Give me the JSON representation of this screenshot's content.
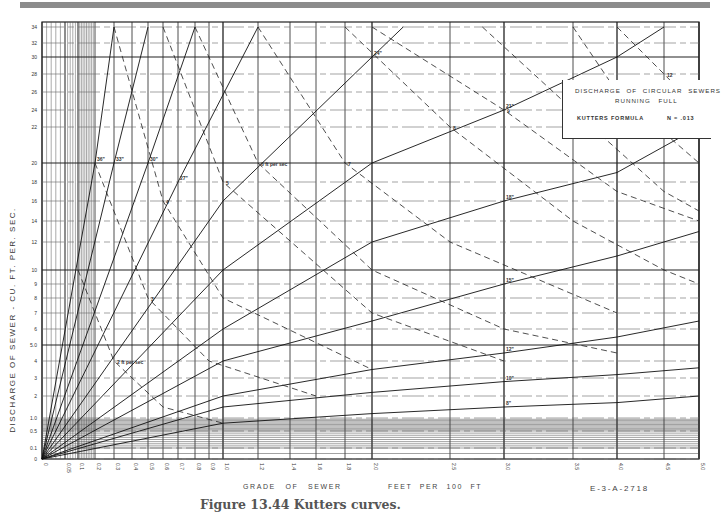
{
  "figure": {
    "caption": "Figure 13.44 Kutters curves.",
    "drawing_number": "E-3-A-2718"
  },
  "title_box": {
    "line1": "DISCHARGE OF CIRCULAR SEWERS",
    "line2": "RUNNING FULL",
    "formula": "KUTTERS FORMULA",
    "n_value": "N = .013"
  },
  "axes": {
    "ylabel": "DISCHARGE OF SEWER - CU. FT. PER. SEC.",
    "xlabel_left": "GRADE OF SEWER",
    "xlabel_right": "FEET PER 100 FT"
  },
  "chart_data": {
    "type": "line",
    "xlabel": "Grade of sewer, feet per 100 ft",
    "ylabel": "Discharge of sewer - cu. ft. per sec.",
    "x_ticks": [
      "0",
      "0.05",
      "0.1",
      "0.2",
      "0.3",
      "0.4",
      "0.5",
      "0.6",
      "0.7",
      "0.8",
      "0.9",
      "1.0",
      "1.2",
      "1.4",
      "1.6",
      "1.8",
      "2.0",
      "2.5",
      "3.0",
      "3.5",
      "4.0",
      "4.5",
      "5.0"
    ],
    "y_ticks": [
      "0",
      "0.1",
      "0.5",
      "1.0",
      "2",
      "3",
      "4",
      "5.0",
      "6",
      "7",
      "8",
      "9",
      "10",
      "12",
      "14",
      "16",
      "18",
      "20",
      "22",
      "24",
      "26",
      "28",
      "30",
      "32",
      "34"
    ],
    "xlim": [
      0,
      5.0
    ],
    "ylim": [
      0,
      34
    ],
    "grid": true,
    "legend_position": "none (curves labeled inline)",
    "pipe_diameter_series": [
      {
        "name": "36\"",
        "style": "solid",
        "points": [
          [
            0.0,
            0
          ],
          [
            0.2,
            20
          ],
          [
            0.3,
            34
          ]
        ]
      },
      {
        "name": "33\"",
        "style": "solid",
        "points": [
          [
            0.0,
            0
          ],
          [
            0.3,
            20
          ],
          [
            0.5,
            34
          ]
        ]
      },
      {
        "name": "30\"",
        "style": "solid",
        "points": [
          [
            0.0,
            0
          ],
          [
            0.5,
            20
          ],
          [
            0.8,
            34
          ]
        ]
      },
      {
        "name": "27\"",
        "style": "solid",
        "points": [
          [
            0.0,
            0
          ],
          [
            0.7,
            18
          ],
          [
            1.2,
            34
          ]
        ]
      },
      {
        "name": "24\"",
        "style": "solid",
        "points": [
          [
            0.0,
            0
          ],
          [
            1.0,
            16
          ],
          [
            2.0,
            30
          ],
          [
            2.2,
            34
          ]
        ]
      },
      {
        "name": "21\"",
        "style": "solid",
        "points": [
          [
            0.0,
            0
          ],
          [
            1.0,
            10
          ],
          [
            2.0,
            20
          ],
          [
            3.0,
            24
          ],
          [
            4.0,
            30
          ],
          [
            4.5,
            34
          ]
        ]
      },
      {
        "name": "18\"",
        "style": "solid",
        "points": [
          [
            0.0,
            0
          ],
          [
            1.0,
            6
          ],
          [
            2.0,
            12
          ],
          [
            3.0,
            16
          ],
          [
            4.0,
            19
          ],
          [
            5.0,
            22
          ]
        ]
      },
      {
        "name": "15\"",
        "style": "solid",
        "points": [
          [
            0.0,
            0
          ],
          [
            1.0,
            4
          ],
          [
            2.0,
            6.5
          ],
          [
            3.0,
            9
          ],
          [
            4.0,
            11
          ],
          [
            5.0,
            13
          ]
        ]
      },
      {
        "name": "12\"",
        "style": "solid",
        "points": [
          [
            0.0,
            0
          ],
          [
            1.0,
            2
          ],
          [
            2.0,
            3.5
          ],
          [
            3.0,
            4.5
          ],
          [
            4.0,
            5.5
          ],
          [
            5.0,
            6.5
          ]
        ]
      },
      {
        "name": "10\"",
        "style": "solid",
        "points": [
          [
            0.0,
            0
          ],
          [
            1.0,
            1.5
          ],
          [
            2.0,
            2.2
          ],
          [
            3.0,
            2.8
          ],
          [
            4.0,
            3.2
          ],
          [
            5.0,
            3.6
          ]
        ]
      },
      {
        "name": "8\"",
        "style": "solid",
        "points": [
          [
            0.0,
            0
          ],
          [
            1.0,
            0.8
          ],
          [
            2.0,
            1.2
          ],
          [
            3.0,
            1.5
          ],
          [
            4.0,
            1.7
          ],
          [
            5.0,
            2.0
          ]
        ]
      }
    ],
    "velocity_series": [
      {
        "name": "2 ft per sec",
        "style": "dashed",
        "points": [
          [
            0.1,
            10
          ],
          [
            0.3,
            4
          ],
          [
            0.6,
            1.5
          ],
          [
            1.0,
            0.8
          ]
        ]
      },
      {
        "name": "3",
        "style": "dashed",
        "points": [
          [
            0.2,
            20
          ],
          [
            0.5,
            8
          ],
          [
            0.9,
            4
          ],
          [
            1.6,
            2
          ]
        ]
      },
      {
        "name": "4",
        "style": "dashed",
        "points": [
          [
            0.3,
            34
          ],
          [
            0.6,
            16
          ],
          [
            1.0,
            8
          ],
          [
            2.0,
            3.5
          ]
        ]
      },
      {
        "name": "5",
        "style": "dashed",
        "points": [
          [
            0.6,
            34
          ],
          [
            1.0,
            18
          ],
          [
            2.0,
            7
          ],
          [
            3.0,
            4
          ]
        ]
      },
      {
        "name": "6 ft per sec",
        "style": "dashed",
        "points": [
          [
            0.8,
            34
          ],
          [
            1.2,
            20
          ],
          [
            2.0,
            10
          ],
          [
            3.0,
            6
          ],
          [
            4.0,
            4.5
          ]
        ]
      },
      {
        "name": "7",
        "style": "dashed",
        "points": [
          [
            1.2,
            34
          ],
          [
            1.8,
            20
          ],
          [
            2.5,
            12
          ],
          [
            4.0,
            7
          ]
        ]
      },
      {
        "name": "8",
        "style": "dashed",
        "points": [
          [
            1.8,
            34
          ],
          [
            2.5,
            22
          ],
          [
            3.5,
            14
          ],
          [
            4.5,
            10
          ],
          [
            5.0,
            9
          ]
        ]
      },
      {
        "name": "9",
        "style": "dashed",
        "points": [
          [
            2.0,
            34
          ],
          [
            3.0,
            24
          ],
          [
            4.0,
            17
          ],
          [
            5.0,
            14
          ]
        ]
      },
      {
        "name": "10 ft per sec",
        "style": "dashed",
        "points": [
          [
            2.8,
            34
          ],
          [
            3.5,
            24
          ],
          [
            4.5,
            17
          ],
          [
            5.0,
            15
          ]
        ]
      },
      {
        "name": "11",
        "style": "dashed",
        "points": [
          [
            3.5,
            34
          ],
          [
            4.0,
            26
          ],
          [
            5.0,
            20
          ]
        ]
      },
      {
        "name": "12",
        "style": "dashed",
        "points": [
          [
            4.0,
            34
          ],
          [
            4.5,
            28
          ],
          [
            5.0,
            24
          ]
        ]
      }
    ],
    "annotations": [
      "N = .013",
      "E-3-A-2718"
    ]
  }
}
